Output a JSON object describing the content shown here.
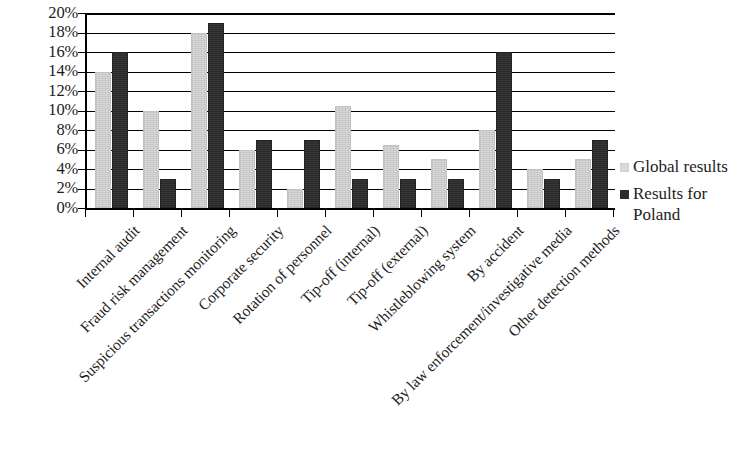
{
  "chart_data": {
    "type": "bar",
    "title": "",
    "subtitle": "",
    "xlabel": "",
    "ylabel": "",
    "ylim": [
      0,
      20
    ],
    "y_unit": "%",
    "grid": true,
    "legend_position": "right",
    "y_ticks": [
      "0%",
      "2%",
      "4%",
      "6%",
      "8%",
      "10%",
      "12%",
      "14%",
      "16%",
      "18%",
      "20%"
    ],
    "y_tick_values": [
      0,
      2,
      4,
      6,
      8,
      10,
      12,
      14,
      16,
      18,
      20
    ],
    "categories": [
      "Internal audit",
      "Fraud risk management",
      "Suspicious transactions monitoring",
      "Corporate security",
      "Rotation of personnel",
      "Tip-off (internal)",
      "Tip-off (external)",
      "Whistleblowing system",
      "By accident",
      "By law enforcement/investigative media",
      "Other detection methods"
    ],
    "series": [
      {
        "name": "Global results",
        "color": "#d9d9d9",
        "values": [
          14,
          10,
          18,
          6,
          2,
          10.5,
          6.5,
          5,
          8,
          4,
          5
        ]
      },
      {
        "name": "Results for Poland",
        "color": "#2b2b2b",
        "values": [
          16,
          3,
          19,
          7,
          7,
          3,
          3,
          3,
          16,
          3,
          7
        ]
      }
    ]
  },
  "legend": {
    "items": [
      {
        "label": "Global results",
        "swatch": "global"
      },
      {
        "label": "Results for\nPoland",
        "swatch": "poland"
      }
    ]
  }
}
